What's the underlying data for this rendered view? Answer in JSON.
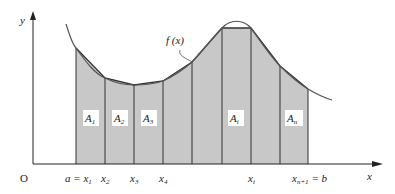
{
  "diagram": {
    "axes": {
      "x_label": "x",
      "y_label": "y",
      "origin_label": "O"
    },
    "curve_label": "f(x)",
    "colors": {
      "fill": "#c8c8c8",
      "stroke": "#333333",
      "curve": "#555555",
      "axis": "#222222"
    },
    "x_ticks": [
      {
        "label": "a = x",
        "sub": "1"
      },
      {
        "label": "x",
        "sub": "2"
      },
      {
        "label": "x",
        "sub": "3"
      },
      {
        "label": "x",
        "sub": "4"
      },
      {
        "label": "x",
        "sub": "i"
      },
      {
        "label": "x",
        "sub": "n+1",
        "suffix": " = b"
      }
    ],
    "area_labels": [
      {
        "label": "A",
        "sub": "1"
      },
      {
        "label": "A",
        "sub": "2"
      },
      {
        "label": "A",
        "sub": "3"
      },
      {
        "label": "A",
        "sub": "i"
      },
      {
        "label": "A",
        "sub": "n"
      }
    ]
  }
}
